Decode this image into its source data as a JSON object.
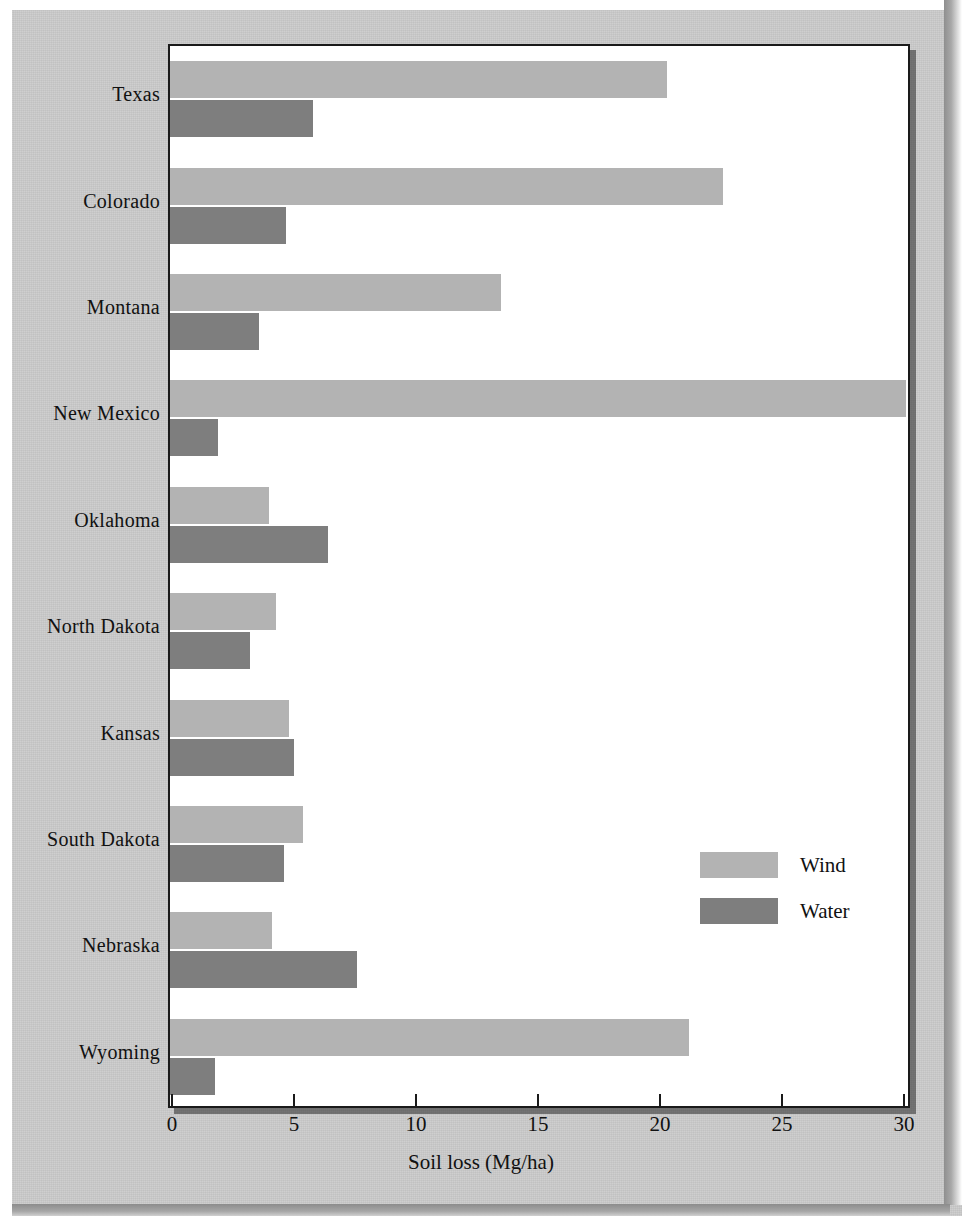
{
  "chart_data": {
    "type": "bar",
    "orientation": "horizontal",
    "title": "",
    "xlabel": "Soil loss (Mg/ha)",
    "ylabel": "",
    "xlim": [
      0,
      31
    ],
    "xticks": [
      0,
      5,
      10,
      15,
      20,
      25,
      30
    ],
    "xtick_labels": [
      "0",
      "5",
      "10",
      "15",
      "20",
      "25",
      "30"
    ],
    "grid": false,
    "legend_position": "center-right",
    "categories": [
      "Texas",
      "Colorado",
      "Montana",
      "New Mexico",
      "Oklahoma",
      "North Dakota",
      "Kansas",
      "South Dakota",
      "Nebraska",
      "Wyoming"
    ],
    "series": [
      {
        "name": "Wind",
        "color": "#b3b3b3",
        "values": [
          20.2,
          22.5,
          13.4,
          30.0,
          3.9,
          4.2,
          4.7,
          5.3,
          4.0,
          21.1
        ]
      },
      {
        "name": "Water",
        "color": "#7e7e7e",
        "values": [
          5.7,
          4.6,
          3.5,
          1.8,
          6.3,
          3.1,
          4.9,
          4.5,
          7.5,
          1.7
        ]
      }
    ]
  },
  "legend": {
    "items": [
      {
        "label": "Wind",
        "color": "#b3b3b3"
      },
      {
        "label": "Water",
        "color": "#7e7e7e"
      }
    ]
  }
}
